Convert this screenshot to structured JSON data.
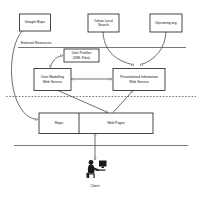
{
  "diagram": {
    "layers": {
      "external_resources_label": "External Resources",
      "divider_solid_top": true,
      "divider_dotted_middle": true,
      "divider_solid_bottom": true
    },
    "nodes": [
      {
        "id": "google-maps",
        "label": "Google Maps",
        "group": "external-resource"
      },
      {
        "id": "yahoo-local-search",
        "label": "Yahoo Local\nSearch",
        "group": "external-resource"
      },
      {
        "id": "upcoming-org",
        "label": "Upcoming.org",
        "group": "external-resource"
      },
      {
        "id": "user-profiles",
        "label": "User  Profiles\n(XML Files)",
        "group": "datastore"
      },
      {
        "id": "user-modelling-web-service",
        "label": "User Modelling\nWeb Service",
        "group": "service"
      },
      {
        "id": "personalised-information-web-service",
        "label": "Personalised Information\nWeb Service",
        "group": "service"
      },
      {
        "id": "maps",
        "label": "Maps",
        "group": "output"
      },
      {
        "id": "web-pages",
        "label": "Web Pages",
        "group": "output"
      }
    ],
    "actor": {
      "id": "client",
      "label": "Client"
    },
    "colors": {
      "background": "#ffffff",
      "box_stroke": "#1a1a1a",
      "connector": "#4a4a4a",
      "divider": "#555555",
      "text": "#111111"
    }
  }
}
